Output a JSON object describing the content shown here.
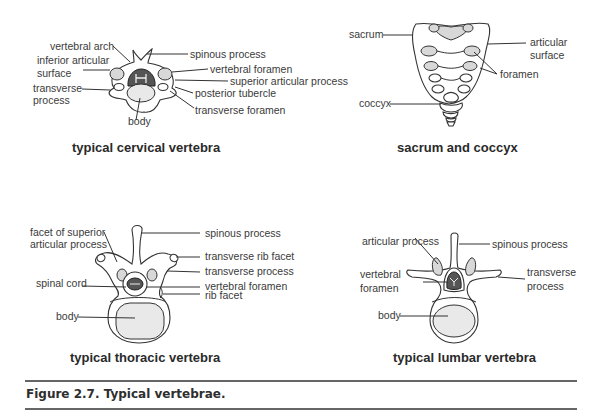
{
  "figure": {
    "caption": "Figure 2.7. Typical vertebrae.",
    "panels": {
      "cervical": {
        "title": "typical cervical vertebra",
        "labels": {
          "vertebral_arch": "vertebral arch",
          "inferior_articular_1": "inferior articular",
          "inferior_articular_2": "surface",
          "transverse_process_1": "transverse",
          "transverse_process_2": "process",
          "body": "body",
          "spinous_process": "spinous process",
          "vertebral_foramen": "vertebral foramen",
          "superior_articular_process": "superior articular process",
          "posterior_tubercle": "posterior tubercle",
          "transverse_foramen": "transverse foramen"
        }
      },
      "sacrum": {
        "title": "sacrum and coccyx",
        "labels": {
          "sacrum": "sacrum",
          "coccyx": "coccyx",
          "articular_surface_1": "articular",
          "articular_surface_2": "surface",
          "foramen": "foramen"
        }
      },
      "thoracic": {
        "title": "typical thoracic vertebra",
        "labels": {
          "facet_1": "facet of superior",
          "facet_2": "articular process",
          "spinal_cord": "spinal cord",
          "body": "body",
          "spinous_process": "spinous process",
          "transverse_rib_facet": "transverse rib facet",
          "transverse_process": "transverse process",
          "vertebral_foramen": "vertebral foramen",
          "rib_facet": "rib facet"
        }
      },
      "lumbar": {
        "title": "typical lumbar vertebra",
        "labels": {
          "articular_process": "articular process",
          "vertebral_foramen_1": "vertebral",
          "vertebral_foramen_2": "foramen",
          "body": "body",
          "spinous_process": "spinous process",
          "transverse_process_1": "transverse",
          "transverse_process_2": "process"
        }
      }
    }
  }
}
